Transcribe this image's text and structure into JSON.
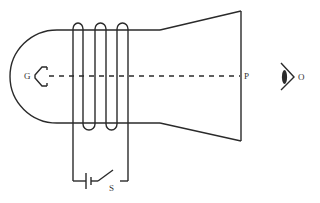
{
  "diagram": {
    "type": "cathode-ray-tube-with-coil-circuit",
    "labels": {
      "gun": "G",
      "screen_point": "P",
      "observer": "O",
      "switch": "S"
    },
    "colors": {
      "line": "#2a2a2a",
      "text": "#333333",
      "background": "#ffffff"
    }
  }
}
